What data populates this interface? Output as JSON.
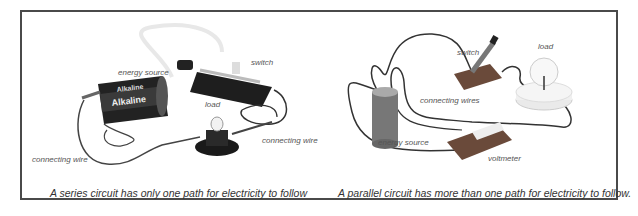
{
  "figure": {
    "series_panel": {
      "labels": {
        "energy_source": "energy source",
        "switch": "switch",
        "load": "load",
        "connecting_wire_right": "connecting wire",
        "connecting_wire_left": "connecting wire"
      },
      "battery_text": "Alkaline",
      "caption": "A series circuit has only one path for electricity to follow"
    },
    "parallel_panel": {
      "labels": {
        "switch": "switch",
        "load": "load",
        "connecting_wires": "connecting wires",
        "energy_source": "energy source",
        "voltmeter": "voltmeter"
      },
      "caption": "A parallel circuit has more than one path for electricity to follow."
    },
    "colors": {
      "frame_border": "#4a4a4a",
      "caption_text": "#333333",
      "label_text": "#555555"
    }
  }
}
